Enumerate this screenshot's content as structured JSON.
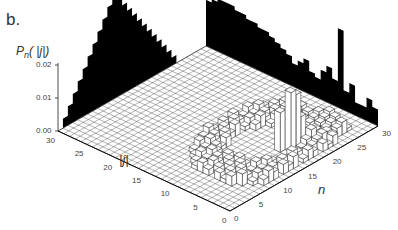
{
  "figure": {
    "panel_label": "b.",
    "z_axis_label": "Pn(|j|)",
    "j_axis_label": "|j|",
    "n_axis_label": "n"
  },
  "chart_data": {
    "type": "3d-bar",
    "title": "",
    "xlabel": "n",
    "ylabel": "|j|",
    "zlabel": "P_n(|j|)",
    "x_ticks": [
      0,
      5,
      10,
      15,
      20,
      25,
      30
    ],
    "y_ticks": [
      0,
      5,
      10,
      15,
      20,
      25,
      30
    ],
    "z_ticks": [
      "0.00",
      "0.01",
      "0.02"
    ],
    "xlim": [
      0,
      30
    ],
    "ylim": [
      0,
      30
    ],
    "zlim": [
      0,
      0.02
    ],
    "grid": true,
    "projections": {
      "back_left_wall_marginal_over_j": "triangular peak, max near |j|=15 (~0.02)",
      "back_right_wall_marginal_over_n": "spiky, tallest spike near n=24, decaying to n=30"
    },
    "notable_bars": [
      {
        "n": 17,
        "j": 4,
        "height": 0.018
      },
      {
        "n": 18,
        "j": 4,
        "height": 0.016
      },
      {
        "n": 16,
        "j": 5,
        "height": 0.012
      },
      {
        "n": 19,
        "j": 4,
        "height": 0.009
      }
    ]
  },
  "ticks": {
    "z": [
      {
        "text": "0.02",
        "v": 0.02
      },
      {
        "text": "0.01",
        "v": 0.01
      },
      {
        "text": "0.00",
        "v": 0.0
      }
    ],
    "j": [
      "30",
      "25",
      "20",
      "15",
      "10",
      "5",
      "0"
    ],
    "n": [
      "0",
      "5",
      "10",
      "15",
      "20",
      "25",
      "30"
    ]
  }
}
